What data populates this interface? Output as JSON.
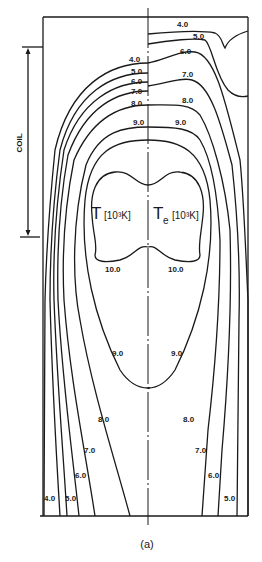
{
  "figure": {
    "caption": "(a)",
    "coil_label": "COIL",
    "left_panel": {
      "symbol": "T",
      "unit": "[10³K]"
    },
    "right_panel": {
      "symbol": "T",
      "subscript": "e",
      "unit": "[10³K]"
    },
    "colors": {
      "ink": "#1a1a1a",
      "background": "#ffffff"
    }
  },
  "contour_labels": {
    "left": {
      "top_4": "4.0",
      "top_5": "5.0",
      "top_6": "6.0",
      "top_7": "7.0",
      "top_8": "8.0",
      "top_9": "9.0",
      "core_10": "10.0",
      "mid_9": "9.0",
      "bot_8": "8.0",
      "bot_7": "7.0",
      "bot_6": "6.0",
      "bot_5": "5.0",
      "bot_4": "4.0"
    },
    "right": {
      "top_4": "4.0",
      "top_5": "5.0",
      "top_6": "6.0",
      "top_7": "7.0",
      "top_8": "8.0",
      "top_9": "9.0",
      "core_10": "10.0",
      "mid_9": "9.0",
      "bot_8": "8.0",
      "bot_7": "7.0",
      "bot_6": "6.0",
      "bot_5": "5.0"
    }
  }
}
